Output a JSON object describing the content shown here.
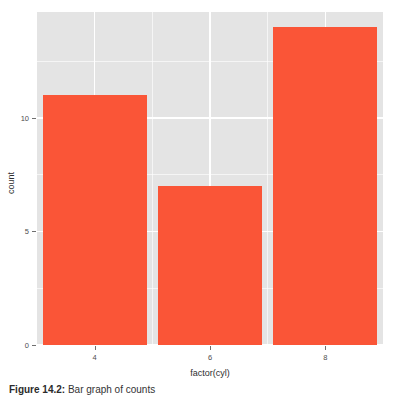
{
  "chart_data": {
    "type": "bar",
    "categories": [
      "4",
      "6",
      "8"
    ],
    "values": [
      11,
      7,
      14
    ],
    "title": "",
    "xlabel": "factor(cyl)",
    "ylabel": "count",
    "ylim": [
      0,
      14
    ],
    "y_ticks": [
      "0",
      "5",
      "10"
    ],
    "y_tick_values": [
      0,
      5,
      10
    ],
    "y_minor_tick_values": [
      2.5,
      7.5,
      12.5
    ],
    "x_ticks": [
      "4",
      "6",
      "8"
    ],
    "grid": "on",
    "legend": "none",
    "bar_color": "#fa5537",
    "panel_background": "#e4e4e4",
    "grid_color": "#ffffff"
  },
  "axis": {
    "x_title": "factor(cyl)",
    "y_title": "count"
  },
  "caption": {
    "label": "Figure 14.2:",
    "text": "Bar graph of counts"
  }
}
